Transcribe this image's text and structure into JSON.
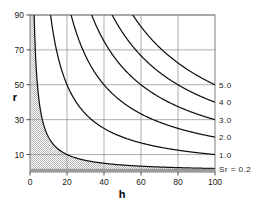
{
  "chart_data": {
    "type": "line",
    "title": "",
    "xlabel": "h",
    "ylabel": "r",
    "xlim": [
      0,
      100
    ],
    "ylim": [
      0,
      90
    ],
    "grid": true,
    "xticks": [
      0,
      20,
      40,
      60,
      80,
      100
    ],
    "xtick_labels": [
      "0",
      "20",
      "40",
      "60",
      "80",
      "100"
    ],
    "yticks": [
      10,
      30,
      50,
      70,
      90
    ],
    "ytick_labels": [
      "10",
      "30",
      "50",
      "70",
      "90"
    ],
    "legend_position": "right-of-curves",
    "relation": "r = Sr_constant * 1000 / h",
    "annotations": [
      {
        "text": "Sr = 0.2",
        "x": 100,
        "y": 2
      },
      {
        "text": "1.0",
        "x": 100,
        "y": 10
      },
      {
        "text": "2.0",
        "x": 100,
        "y": 20
      },
      {
        "text": "3.0",
        "x": 100,
        "y": 30
      },
      {
        "text": "4 0",
        "x": 100,
        "y": 40
      },
      {
        "text": "5.0",
        "x": 100,
        "y": 50
      }
    ],
    "shaded_region": {
      "label": "region below Sr = 0.2",
      "pattern": "stipple",
      "color": "#c9c9c9"
    },
    "series": [
      {
        "name": "Sr = 0.2",
        "constant": 200,
        "label": "Sr = 0.2",
        "x": [
          2.2,
          3,
          4,
          5,
          6,
          8,
          10,
          13,
          16,
          20,
          25,
          30,
          40,
          50,
          60,
          70,
          80,
          90,
          100
        ],
        "values": [
          90,
          66.7,
          50,
          40,
          33.3,
          25,
          20,
          15.4,
          12.5,
          10,
          8,
          6.7,
          5,
          4,
          3.3,
          2.9,
          2.5,
          2.2,
          2
        ]
      },
      {
        "name": "1.0",
        "constant": 1000,
        "label": "1.0",
        "x": [
          11.1,
          13,
          15,
          18,
          22,
          26,
          30,
          35,
          40,
          50,
          60,
          70,
          80,
          90,
          100
        ],
        "values": [
          90,
          76.9,
          66.7,
          55.6,
          45.5,
          38.5,
          33.3,
          28.6,
          25,
          20,
          16.7,
          14.3,
          12.5,
          11.1,
          10
        ]
      },
      {
        "name": "2.0",
        "constant": 2000,
        "label": "2.0",
        "x": [
          22.2,
          25,
          28,
          32,
          36,
          40,
          45,
          50,
          60,
          70,
          80,
          90,
          100
        ],
        "values": [
          90,
          80,
          71.4,
          62.5,
          55.6,
          50,
          44.4,
          40,
          33.3,
          28.6,
          25,
          22.2,
          20
        ]
      },
      {
        "name": "3.0",
        "constant": 3000,
        "label": "3.0",
        "x": [
          33.3,
          36,
          40,
          45,
          50,
          56,
          62,
          70,
          80,
          90,
          100
        ],
        "values": [
          90,
          83.3,
          75,
          66.7,
          60,
          53.6,
          48.4,
          42.9,
          37.5,
          33.3,
          30
        ]
      },
      {
        "name": "4 0",
        "constant": 4000,
        "label": "4 0",
        "x": [
          44.4,
          48,
          52,
          58,
          64,
          70,
          78,
          86,
          94,
          100
        ],
        "values": [
          90,
          83.3,
          76.9,
          69,
          62.5,
          57.1,
          51.3,
          46.5,
          42.6,
          40
        ]
      },
      {
        "name": "5.0",
        "constant": 5000,
        "label": "5.0",
        "x": [
          55.6,
          60,
          65,
          70,
          76,
          82,
          88,
          94,
          100
        ],
        "values": [
          90,
          83.3,
          76.9,
          71.4,
          65.8,
          61,
          56.8,
          53.2,
          50
        ]
      }
    ]
  },
  "axes": {
    "x_title": "h",
    "y_title": "r"
  }
}
